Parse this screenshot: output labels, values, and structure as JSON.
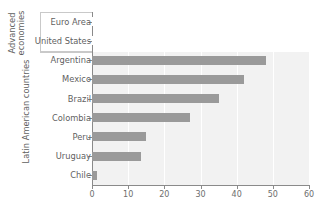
{
  "chart_data": {
    "type": "bar",
    "orientation": "horizontal",
    "title": "",
    "xlabel": "",
    "ylabel": "",
    "xlim": [
      0,
      60
    ],
    "xticks": [
      0,
      10,
      20,
      30,
      40,
      50,
      60
    ],
    "xticklabels": [
      "0",
      "10",
      "20",
      "30",
      "40",
      "50",
      "60"
    ],
    "grid": true,
    "grid_axis": "x",
    "legend": false,
    "categories": [
      "Euro Area",
      "United States",
      "Argentina",
      "Mexico",
      "Brazil",
      "Colombia",
      "Peru",
      "Uruguay",
      "Chile"
    ],
    "values": [
      19.5,
      15.0,
      48.0,
      42.0,
      35.0,
      27.0,
      15.0,
      13.5,
      1.5
    ],
    "bar_colors": [
      "#ffffff",
      "#ffffff",
      "#9a9a9a",
      "#9a9a9a",
      "#9a9a9a",
      "#9a9a9a",
      "#9a9a9a",
      "#9a9a9a",
      "#9a9a9a"
    ],
    "groups": [
      {
        "label": "Advanced\neconomies",
        "categories": [
          "Euro Area",
          "United States"
        ]
      },
      {
        "label": "Latin American countries",
        "categories": [
          "Argentina",
          "Mexico",
          "Brazil",
          "Colombia",
          "Peru",
          "Uruguay",
          "Chile"
        ]
      }
    ],
    "plot_background": "#f2f2f2",
    "gridline_color": "#ffffff",
    "axis_color": "#8a8a8a"
  },
  "groups": {
    "advanced_line1": "Advanced",
    "advanced_line2": "economies",
    "latin": "Latin American countries"
  },
  "categories": {
    "c0": "Euro Area",
    "c1": "United States",
    "c2": "Argentina",
    "c3": "Mexico",
    "c4": "Brazil",
    "c5": "Colombia",
    "c6": "Peru",
    "c7": "Uruguay",
    "c8": "Chile"
  },
  "xticklabels": {
    "t0": "0",
    "t1": "10",
    "t2": "20",
    "t3": "30",
    "t4": "40",
    "t5": "50",
    "t6": "60"
  }
}
